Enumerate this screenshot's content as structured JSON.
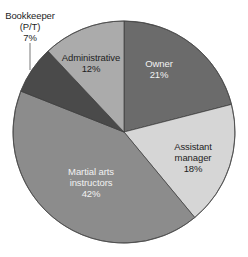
{
  "chart_data": {
    "type": "pie",
    "title": "",
    "start_angle_deg": 0,
    "direction": "clockwise",
    "categories": [
      "Owner",
      "Assistant manager",
      "Martial arts instructors",
      "Bookkeeper (P/T)",
      "Administrative"
    ],
    "values": [
      21,
      18,
      42,
      7,
      12
    ],
    "unit": "%",
    "colors": [
      "#6b6b6b",
      "#d6d6d6",
      "#8c8c8c",
      "#4a4a4a",
      "#ababab"
    ],
    "legend": "none",
    "slices": [
      {
        "label_lines": [
          "Owner"
        ],
        "pct": "21%",
        "value": 21,
        "color": "#6b6b6b",
        "text_color": "#f2f2f2",
        "label_pos": [
          159,
          64
        ]
      },
      {
        "label_lines": [
          "Assistant",
          "manager"
        ],
        "pct": "18%",
        "value": 18,
        "color": "#d6d6d6",
        "text_color": "#1e1e1e",
        "label_pos": [
          191,
          140
        ]
      },
      {
        "label_lines": [
          "Martial arts",
          "instructors"
        ],
        "pct": "42%",
        "value": 42,
        "color": "#8c8c8c",
        "text_color": "#f2f2f2",
        "label_pos": [
          91,
          169
        ]
      },
      {
        "label_lines": [
          "Bookkeeper",
          "(P/T)"
        ],
        "pct": "7%",
        "value": 7,
        "color": "#4a4a4a",
        "text_color": "#1e1e1e",
        "label_pos": [
          30,
          4
        ],
        "leader_line": [
          [
            30,
            43
          ],
          [
            30,
            70
          ]
        ]
      },
      {
        "label_lines": [
          "Administrative"
        ],
        "pct": "12%",
        "value": 12,
        "color": "#ababab",
        "text_color": "#1e1e1e",
        "label_pos": [
          89,
          51
        ]
      }
    ]
  },
  "labels": {
    "owner": {
      "line1": "Owner",
      "pct": "21%"
    },
    "assistant": {
      "line1": "Assistant",
      "line2": "manager",
      "pct": "18%"
    },
    "martial": {
      "line1": "Martial arts",
      "line2": "instructors",
      "pct": "42%"
    },
    "bookkeeper": {
      "line1": "Bookkeeper",
      "line2": "(P/T)",
      "pct": "7%"
    },
    "administrative": {
      "line1": "Administrative",
      "pct": "12%"
    }
  }
}
